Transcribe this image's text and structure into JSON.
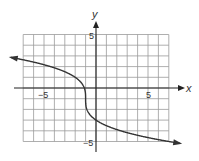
{
  "chart_data": {
    "type": "line",
    "title": "",
    "xlabel": "x",
    "ylabel": "y",
    "xlim": [
      -7,
      7
    ],
    "ylim": [
      -5,
      5
    ],
    "grid": true,
    "grid_step": 1,
    "tick_labels": {
      "x": [
        {
          "value": -5,
          "label": "−5"
        },
        {
          "value": 5,
          "label": "5"
        }
      ],
      "y": [
        {
          "value": 5,
          "label": "5"
        },
        {
          "value": -5,
          "label": "−5"
        }
      ]
    },
    "function": "y = -2*cbrt(x + 1) - 1",
    "series": [
      {
        "name": "curve",
        "x": [
          -8.2,
          -7,
          -6,
          -5,
          -4,
          -3,
          -2,
          -1.5,
          -1.1,
          -1,
          -0.9,
          -0.5,
          0,
          1,
          2,
          3,
          4,
          5,
          6,
          7,
          8.3
        ],
        "y": [
          2.86,
          2.83,
          2.83,
          2.63,
          2.42,
          1.52,
          1.0,
          0.59,
          -0.07,
          -1,
          -1.93,
          -2.59,
          -3,
          -3.52,
          -3.88,
          -4.17,
          -4.42,
          -4.63,
          -4.83,
          -5.0,
          -5.2
        ],
        "arrows": "both ends"
      }
    ],
    "axis_labels": {
      "x": "x",
      "y": "y"
    }
  }
}
